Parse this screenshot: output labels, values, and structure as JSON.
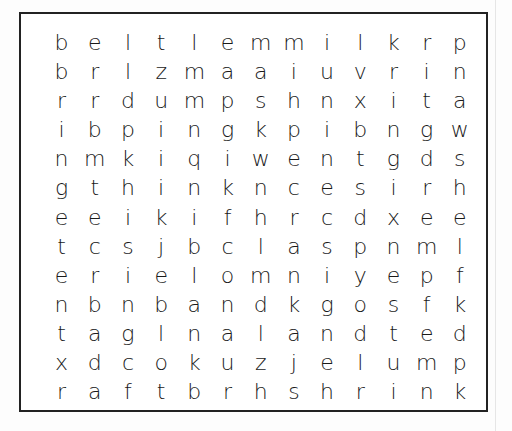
{
  "puzzle": {
    "type": "word-search",
    "rows": 13,
    "cols": 13,
    "grid": [
      [
        "b",
        "e",
        "l",
        "t",
        "l",
        "e",
        "m",
        "m",
        "i",
        "l",
        "k",
        "r",
        "p"
      ],
      [
        "b",
        "r",
        "l",
        "z",
        "m",
        "a",
        "a",
        "i",
        "u",
        "v",
        "r",
        "i",
        "n"
      ],
      [
        "r",
        "r",
        "d",
        "u",
        "m",
        "p",
        "s",
        "h",
        "n",
        "x",
        "i",
        "t",
        "a"
      ],
      [
        "i",
        "b",
        "p",
        "i",
        "n",
        "g",
        "k",
        "p",
        "i",
        "b",
        "n",
        "g",
        "w"
      ],
      [
        "n",
        "m",
        "k",
        "i",
        "q",
        "i",
        "w",
        "e",
        "n",
        "t",
        "g",
        "d",
        "s"
      ],
      [
        "g",
        "t",
        "h",
        "i",
        "n",
        "k",
        "n",
        "c",
        "e",
        "s",
        "i",
        "r",
        "h"
      ],
      [
        "e",
        "e",
        "i",
        "k",
        "i",
        "f",
        "h",
        "r",
        "c",
        "d",
        "x",
        "e",
        "e"
      ],
      [
        "t",
        "c",
        "s",
        "j",
        "b",
        "c",
        "l",
        "a",
        "s",
        "p",
        "n",
        "m",
        "l"
      ],
      [
        "e",
        "r",
        "i",
        "e",
        "l",
        "o",
        "m",
        "n",
        "i",
        "y",
        "e",
        "p",
        "f"
      ],
      [
        "n",
        "b",
        "n",
        "b",
        "a",
        "n",
        "d",
        "k",
        "g",
        "o",
        "s",
        "f",
        "k"
      ],
      [
        "t",
        "a",
        "g",
        "l",
        "n",
        "a",
        "l",
        "a",
        "n",
        "d",
        "t",
        "e",
        "d"
      ],
      [
        "x",
        "d",
        "c",
        "o",
        "k",
        "u",
        "z",
        "j",
        "e",
        "l",
        "u",
        "m",
        "p"
      ],
      [
        "r",
        "a",
        "f",
        "t",
        "b",
        "r",
        "h",
        "s",
        "h",
        "r",
        "i",
        "n",
        "k"
      ]
    ]
  }
}
